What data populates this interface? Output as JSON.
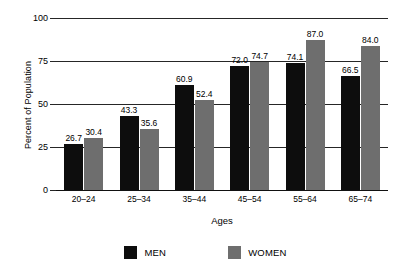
{
  "chart_data": {
    "type": "bar",
    "title": "",
    "xlabel": "Ages",
    "ylabel": "Percent of Population",
    "ylim": [
      0,
      100
    ],
    "yticks": [
      0,
      25,
      50,
      75,
      100
    ],
    "ytick_labels": [
      "0",
      "25",
      "50",
      "75",
      "100"
    ],
    "grid": true,
    "legend_position": "bottom",
    "categories": [
      "20–24",
      "25–34",
      "35–44",
      "45–54",
      "55–64",
      "65–74"
    ],
    "series": [
      {
        "name": "MEN",
        "color": "#0d0d0d",
        "values": [
          26.7,
          43.3,
          60.9,
          72.0,
          74.1,
          66.5
        ],
        "labels": [
          "26.7",
          "43.3",
          "60.9",
          "72.0",
          "74.1",
          "66.5"
        ]
      },
      {
        "name": "WOMEN",
        "color": "#6e6e6e",
        "values": [
          30.4,
          35.6,
          52.4,
          74.7,
          87.0,
          84.0
        ],
        "labels": [
          "30.4",
          "35.6",
          "52.4",
          "74.7",
          "87.0",
          "84.0"
        ]
      }
    ]
  },
  "legend": {
    "men_label": "MEN",
    "women_label": "WOMEN"
  }
}
